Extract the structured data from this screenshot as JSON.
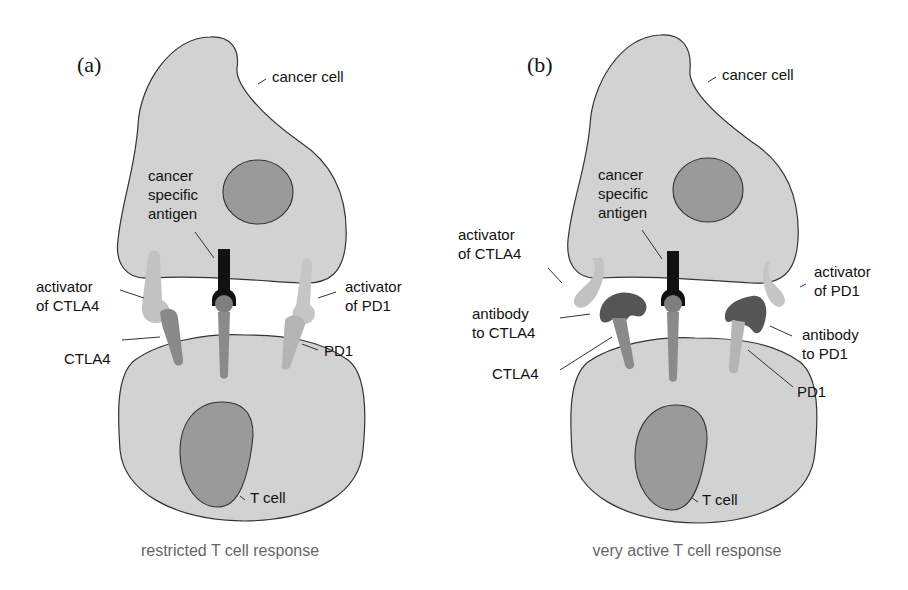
{
  "figure": {
    "panels": [
      {
        "id": "a",
        "label": "(a)",
        "caption": "restricted T cell response",
        "labels": {
          "cancer_cell": "cancer cell",
          "antigen_1": "cancer",
          "antigen_2": "specific",
          "antigen_3": "antigen",
          "act_ctla4_1": "activator",
          "act_ctla4_2": "of CTLA4",
          "ctla4": "CTLA4",
          "act_pd1_1": "activator",
          "act_pd1_2": "of PD1",
          "pd1": "PD1",
          "t_cell": "T cell"
        }
      },
      {
        "id": "b",
        "label": "(b)",
        "caption": "very active T cell response",
        "labels": {
          "cancer_cell": "cancer cell",
          "antigen_1": "cancer",
          "antigen_2": "specific",
          "antigen_3": "antigen",
          "act_ctla4_1": "activator",
          "act_ctla4_2": "of CTLA4",
          "ab_ctla4_1": "antibody",
          "ab_ctla4_2": "to CTLA4",
          "ctla4": "CTLA4",
          "act_pd1_1": "activator",
          "act_pd1_2": "of PD1",
          "ab_pd1_1": "antibody",
          "ab_pd1_2": "to PD1",
          "pd1": "PD1",
          "t_cell": "T cell"
        }
      }
    ],
    "colors": {
      "cell_fill": "#d2d2d2",
      "nucleus_fill": "#9a9a9a",
      "antigen": "#111111",
      "ctla4": "#8a8a8a",
      "pd1": "#b4b4b4",
      "activator": "#c2c2c2",
      "antibody": "#555555",
      "caption": "#666666"
    }
  }
}
